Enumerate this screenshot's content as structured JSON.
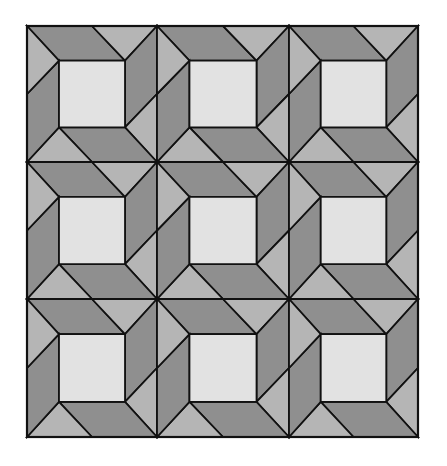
{
  "figure": {
    "title": ""
  },
  "layout": {
    "canvas": {
      "width": 447,
      "height": 466
    },
    "grid": {
      "rows": 3,
      "cols": 3,
      "col_edges": [
        27,
        157,
        289,
        418
      ],
      "row_edges": [
        26,
        162,
        299,
        437
      ]
    },
    "block": {
      "inset_x": 0.246,
      "inset_y": 0.255,
      "mid_x": 0.5,
      "mid_y": 0.5
    }
  },
  "colors": {
    "background": "#ffffff",
    "dark": "#8f8f8f",
    "light": "#b5b5b5",
    "center": "#e2e2e2",
    "stroke": "#111111"
  },
  "stroke_width": 1.8
}
